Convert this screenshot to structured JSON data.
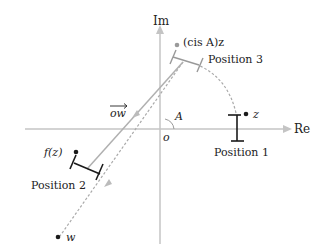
{
  "diagram": {
    "axes": {
      "real_label": "Re",
      "imag_label": "Im",
      "origin_label": "o"
    },
    "points": {
      "z": "z",
      "w": "w",
      "rotated": "(cis A)z",
      "image": "f(z)"
    },
    "vector_label": "ow",
    "angle_label": "A",
    "positions": [
      "Position 1",
      "Position 2",
      "Position 3"
    ],
    "colors": {
      "axis": "#bbbbbb",
      "path": "#aaaaaa",
      "segment": "#1a1a1a",
      "ghost_segment": "#999999"
    }
  }
}
